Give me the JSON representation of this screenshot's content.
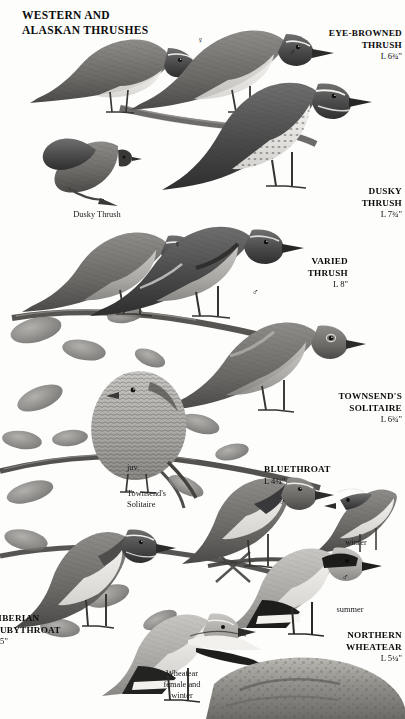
{
  "page": {
    "title_line1": "WESTERN AND",
    "title_line2": "ALASKAN THRUSHES",
    "title": "WESTERN AND\nALASKAN THRUSHES",
    "background_color": "#fdfdfc",
    "ink_color": "#0b0b0b",
    "width": 405,
    "height": 719
  },
  "species": [
    {
      "id": "eye-browed-thrush",
      "name_line1": "EYE-BROWNED",
      "name_line2": "THRUSH",
      "length": "L 6¾\""
    },
    {
      "id": "dusky-thrush",
      "name_line1": "DUSKY",
      "name_line2": "THRUSH",
      "length": "L 7¾\""
    },
    {
      "id": "varied-thrush",
      "name_line1": "VARIED",
      "name_line2": "THRUSH",
      "length": "L 8\""
    },
    {
      "id": "townsends-solitaire",
      "name_line1": "TOWNSEND'S",
      "name_line2": "SOLITAIRE",
      "length": "L 6¾\""
    },
    {
      "id": "bluethroat",
      "name_line1": "BLUETHROAT",
      "name_line2": "",
      "length": "L 4¾\""
    },
    {
      "id": "siberian-rubythroat",
      "name_line1": "SIBERIAN",
      "name_line2": "RUBYTHROAT",
      "length": "L 5\""
    },
    {
      "id": "northern-wheatear",
      "name_line1": "NORTHERN",
      "name_line2": "WHEATEAR",
      "length": "L 5¼\""
    }
  ],
  "captions": {
    "dusky_thrush": "Dusky Thrush",
    "juvenile": "juv.",
    "townsends_solitaire": "Townsend's\nSolitaire",
    "winter": "winter",
    "summer": "summer",
    "wheatear_female_winter": "Wheatear\nfemale and\nwinter"
  },
  "sex_symbols": {
    "male": "♂",
    "female": "♀"
  },
  "markers": [
    {
      "id": "eye-browed-female",
      "symbol": "♀"
    },
    {
      "id": "eye-browed-male",
      "symbol": "♂"
    },
    {
      "id": "varied-female",
      "symbol": "♀"
    },
    {
      "id": "varied-male",
      "symbol": "♂"
    },
    {
      "id": "bluethroat-male",
      "symbol": "♂"
    },
    {
      "id": "wheatear-male",
      "symbol": "♂"
    }
  ]
}
